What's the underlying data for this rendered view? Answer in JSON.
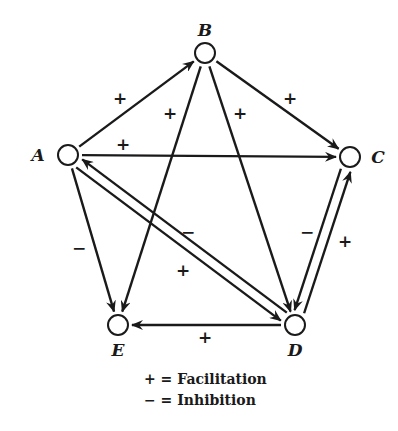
{
  "diagram": {
    "nodes": [
      {
        "id": "A",
        "label": "A",
        "x": 68,
        "y": 155,
        "lx": 38,
        "ly": 161
      },
      {
        "id": "B",
        "label": "B",
        "x": 205,
        "y": 53,
        "lx": 205,
        "ly": 36
      },
      {
        "id": "C",
        "label": "C",
        "x": 350,
        "y": 157,
        "lx": 378,
        "ly": 163
      },
      {
        "id": "D",
        "label": "D",
        "x": 295,
        "y": 325,
        "lx": 295,
        "ly": 356
      },
      {
        "id": "E",
        "label": "E",
        "x": 118,
        "y": 325,
        "lx": 118,
        "ly": 356
      }
    ],
    "edges": [
      {
        "from": "A",
        "to": "B",
        "sign": "+",
        "sx": 120,
        "sy": 104
      },
      {
        "from": "B",
        "to": "C",
        "sign": "+",
        "sx": 290,
        "sy": 104
      },
      {
        "from": "A",
        "to": "C",
        "sign": "+",
        "sx": 123,
        "sy": 150
      },
      {
        "from": "B",
        "to": "E",
        "sign": "+",
        "sx": 170,
        "sy": 119
      },
      {
        "from": "B",
        "to": "D",
        "sign": "+",
        "sx": 240,
        "sy": 119
      },
      {
        "from": "A",
        "to": "E",
        "sign": "−",
        "sx": 79,
        "sy": 254
      },
      {
        "from": "A",
        "to": "D",
        "sign": "−",
        "sx": 188,
        "sy": 238
      },
      {
        "from": "D",
        "to": "A",
        "sign": "+",
        "sx": 183,
        "sy": 276
      },
      {
        "from": "D",
        "to": "C",
        "sign": "−",
        "sx": 307,
        "sy": 238
      },
      {
        "from": "C",
        "to": "D",
        "sign": "+",
        "sx": 345,
        "sy": 247
      },
      {
        "from": "D",
        "to": "E",
        "sign": "+",
        "sx": 205,
        "sy": 343
      }
    ]
  },
  "legend": {
    "facilitation": {
      "symbol": "+",
      "eq": "=",
      "text": "Facilitation"
    },
    "inhibition": {
      "symbol": "−",
      "eq": "=",
      "text": "Inhibition"
    }
  }
}
